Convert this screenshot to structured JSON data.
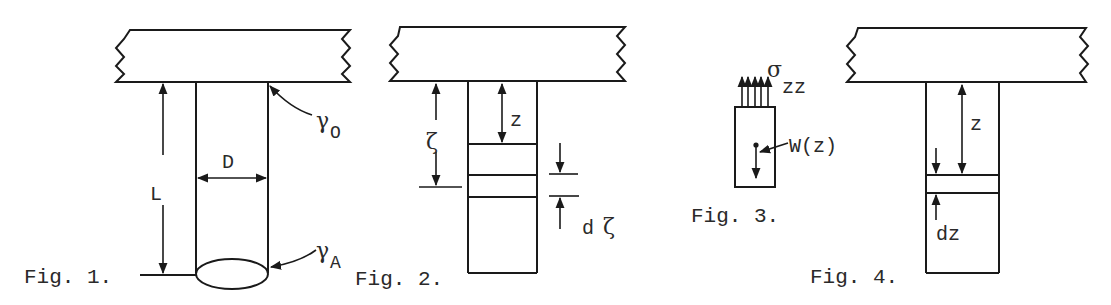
{
  "figures": [
    {
      "id": "fig1",
      "caption": "Fig. 1.",
      "labels": {
        "length": "L",
        "diameter": "D",
        "top_gamma": "γ",
        "top_sub": "O",
        "bottom_gamma": "γ",
        "bottom_sub": "A"
      }
    },
    {
      "id": "fig2",
      "caption": "Fig. 2.",
      "labels": {
        "zeta": "ζ",
        "z": "z",
        "dzeta_d": "d",
        "dzeta_zeta": "ζ"
      }
    },
    {
      "id": "fig3",
      "caption": "Fig. 3.",
      "labels": {
        "sigma": "σ",
        "sigma_sub": "zz",
        "weight": "W(z)"
      }
    },
    {
      "id": "fig4",
      "caption": "Fig. 4.",
      "labels": {
        "z": "z",
        "dz": "dz"
      }
    }
  ],
  "colors": {
    "ink": "#1a1a1a",
    "paper": "#ffffff"
  }
}
